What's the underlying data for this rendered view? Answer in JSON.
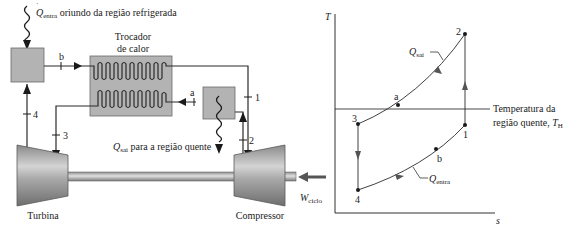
{
  "schematic": {
    "heat_in_label": {
      "symbol": "Q",
      "subscript": "entra",
      "text": " oriundo da região refrigerada"
    },
    "heat_exchanger_label": {
      "line1": "Trocador",
      "line2": "de calor"
    },
    "heat_out_label": {
      "symbol": "Q",
      "subscript": "sai",
      "text": " para a região quente"
    },
    "turbine_label": "Turbina",
    "compressor_label": "Compressor",
    "work_label": {
      "symbol": "W",
      "subscript": "ciclo"
    },
    "state_labels": {
      "s1": "1",
      "s2": "2",
      "s3": "3",
      "s4": "4",
      "sa": "a",
      "sb": "b"
    }
  },
  "ts_diagram": {
    "y_axis_label": "T",
    "x_axis_label": "s",
    "hot_temp_label": {
      "line1": "Temperatura da",
      "line2": "região quente, ",
      "symbol": "T",
      "subscript": "H"
    },
    "q_out_label": {
      "symbol": "Q",
      "subscript": "sai"
    },
    "q_in_label": {
      "symbol": "Q",
      "subscript": "entra"
    },
    "points": [
      {
        "id": "1",
        "label": "1"
      },
      {
        "id": "2",
        "label": "2"
      },
      {
        "id": "3",
        "label": "3"
      },
      {
        "id": "4",
        "label": "4"
      },
      {
        "id": "a",
        "label": "a"
      },
      {
        "id": "b",
        "label": "b"
      }
    ]
  }
}
